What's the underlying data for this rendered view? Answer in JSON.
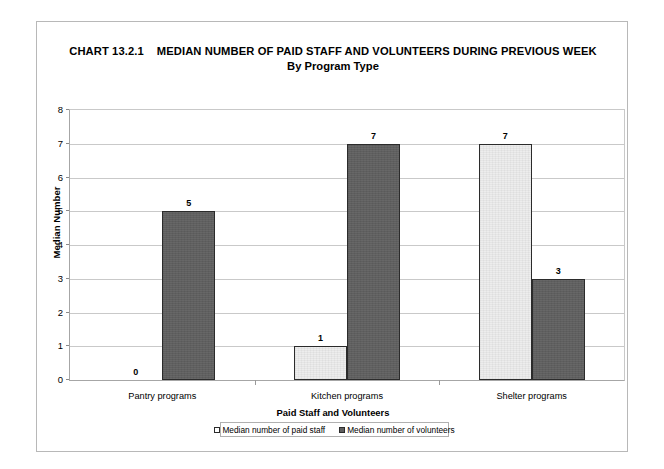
{
  "chart_data": {
    "type": "bar",
    "title_chart_number": "CHART 13.2.1",
    "title_main": "MEDIAN NUMBER OF PAID STAFF AND VOLUNTEERS DURING PREVIOUS WEEK",
    "subtitle": "By Program Type",
    "xlabel": "Paid Staff and Volunteers",
    "ylabel": "Median Number",
    "categories": [
      "Pantry programs",
      "Kitchen programs",
      "Shelter programs"
    ],
    "series": [
      {
        "name": "Median number of paid staff",
        "values": [
          0,
          1,
          7
        ],
        "color": "#ededed"
      },
      {
        "name": "Median number of volunteers",
        "values": [
          5,
          7,
          3
        ],
        "color": "#5f5f5f"
      }
    ],
    "ylim": [
      0,
      8
    ],
    "yticks": [
      8,
      7,
      6,
      5,
      4,
      3,
      2,
      1,
      0
    ],
    "grid": true,
    "legend_position": "bottom",
    "data_labels": true
  },
  "legend": {
    "items": [
      {
        "label": "Median number of paid staff",
        "swatch": "light-square-icon"
      },
      {
        "label": "Median number of volunteers",
        "swatch": "dark-square-icon"
      }
    ]
  }
}
